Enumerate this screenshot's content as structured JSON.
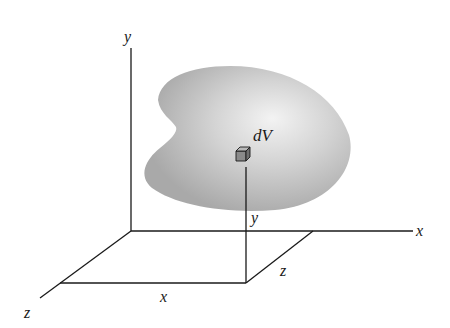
{
  "diagram": {
    "type": "3d-coordinate-volume-element",
    "axes": {
      "y_label": "y",
      "x_label": "x",
      "z_label": "z"
    },
    "body": {
      "element_label": "dV",
      "fill_color_center": "#f2f2f2",
      "fill_color_edge": "#a8a8a8"
    },
    "dimension_labels": {
      "bottom_x": "x",
      "vertical_y": "y",
      "depth_z": "z"
    },
    "colors": {
      "line": "#1a1a1a",
      "cube_front": "#8a8a8a",
      "cube_top": "#b5b5b5",
      "cube_side": "#707070"
    }
  }
}
